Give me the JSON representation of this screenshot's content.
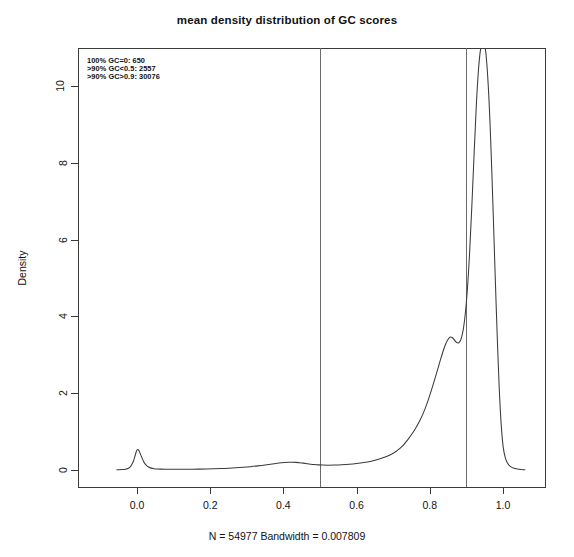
{
  "chart_data": {
    "type": "line",
    "title": "mean density distribution of GC scores",
    "xlabel": "N = 54977   Bandwidth = 0.007809",
    "ylabel": "Density",
    "xlim": [
      -0.06,
      1.06
    ],
    "ylim": [
      -0.35,
      11.55
    ],
    "xticks": [
      "0.0",
      "0.2",
      "0.4",
      "0.6",
      "0.8",
      "1.0"
    ],
    "xtick_values": [
      0.0,
      0.2,
      0.4,
      0.6,
      0.8,
      1.0
    ],
    "yticks": [
      "0",
      "2",
      "4",
      "6",
      "8",
      "10"
    ],
    "ytick_values": [
      0,
      2,
      4,
      6,
      8,
      10
    ],
    "grid": false,
    "legend": "none",
    "line_color": "#3a3a3a",
    "frame_color": "#3a3a3a",
    "vline_color": "#6a6a6a",
    "vlines": [
      0.5,
      0.9
    ],
    "series": [
      {
        "name": "mean density of GC scores",
        "x": [
          -0.055,
          -0.045,
          -0.035,
          -0.028,
          -0.022,
          -0.016,
          -0.01,
          -0.005,
          0.0,
          0.005,
          0.01,
          0.016,
          0.022,
          0.028,
          0.035,
          0.042,
          0.05,
          0.06,
          0.07,
          0.085,
          0.1,
          0.12,
          0.14,
          0.16,
          0.18,
          0.2,
          0.22,
          0.24,
          0.26,
          0.28,
          0.3,
          0.32,
          0.34,
          0.36,
          0.38,
          0.395,
          0.41,
          0.42,
          0.43,
          0.44,
          0.45,
          0.46,
          0.47,
          0.48,
          0.49,
          0.5,
          0.515,
          0.53,
          0.55,
          0.57,
          0.59,
          0.61,
          0.63,
          0.65,
          0.67,
          0.69,
          0.71,
          0.73,
          0.75,
          0.765,
          0.78,
          0.795,
          0.81,
          0.822,
          0.834,
          0.844,
          0.852,
          0.858,
          0.864,
          0.87,
          0.876,
          0.882,
          0.888,
          0.894,
          0.9,
          0.906,
          0.912,
          0.918,
          0.924,
          0.93,
          0.936,
          0.942,
          0.947,
          0.951,
          0.955,
          0.959,
          0.963,
          0.967,
          0.971,
          0.975,
          0.979,
          0.983,
          0.987,
          0.991,
          0.995,
          1.0,
          1.006,
          1.014,
          1.024,
          1.036,
          1.05,
          1.06
        ],
        "y": [
          0.005,
          0.008,
          0.014,
          0.025,
          0.048,
          0.105,
          0.215,
          0.38,
          0.545,
          0.52,
          0.4,
          0.255,
          0.155,
          0.095,
          0.058,
          0.04,
          0.03,
          0.024,
          0.021,
          0.019,
          0.018,
          0.018,
          0.019,
          0.021,
          0.024,
          0.028,
          0.033,
          0.04,
          0.05,
          0.062,
          0.078,
          0.096,
          0.118,
          0.145,
          0.172,
          0.19,
          0.2,
          0.203,
          0.202,
          0.196,
          0.186,
          0.172,
          0.158,
          0.145,
          0.136,
          0.13,
          0.126,
          0.126,
          0.132,
          0.142,
          0.158,
          0.18,
          0.21,
          0.25,
          0.305,
          0.38,
          0.49,
          0.66,
          0.92,
          1.14,
          1.42,
          1.79,
          2.25,
          2.64,
          3.03,
          3.31,
          3.44,
          3.47,
          3.43,
          3.35,
          3.3,
          3.33,
          3.47,
          3.8,
          4.35,
          5.15,
          6.25,
          7.55,
          8.9,
          10.05,
          10.8,
          11.15,
          11.2,
          11.05,
          10.7,
          10.15,
          9.4,
          8.45,
          7.35,
          6.15,
          4.95,
          3.8,
          2.75,
          1.85,
          1.15,
          0.6,
          0.3,
          0.14,
          0.065,
          0.03,
          0.012,
          0.006
        ]
      }
    ],
    "annotations": [
      "100% GC=0: 650",
      ">90% GC<0.5: 2557",
      ">90% GC>0.9: 30076"
    ]
  }
}
